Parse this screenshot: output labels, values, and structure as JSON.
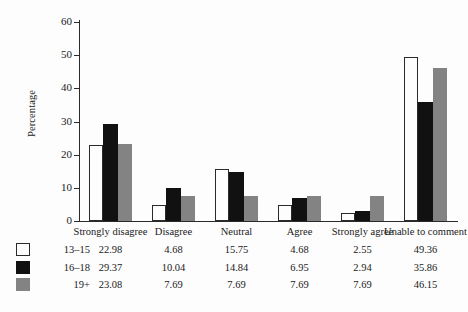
{
  "chart_data": {
    "type": "bar",
    "title": "",
    "xlabel": "",
    "ylabel": "Percentage",
    "ylim": [
      0,
      60
    ],
    "yticks": [
      0,
      10,
      20,
      30,
      40,
      50,
      60
    ],
    "grid": false,
    "legend_position": "bottom-left",
    "categories": [
      "Strongly disagree",
      "Disagree",
      "Neutral",
      "Agree",
      "Strongly agree",
      "Unable to comment"
    ],
    "series": [
      {
        "name": "13–15",
        "color": "#ffffff",
        "values": [
          22.98,
          4.68,
          15.75,
          4.68,
          2.55,
          49.36
        ]
      },
      {
        "name": "16–18",
        "color": "#111111",
        "values": [
          29.37,
          10.04,
          14.84,
          6.95,
          2.94,
          35.86
        ]
      },
      {
        "name": "19+",
        "color": "#838383",
        "values": [
          23.08,
          7.69,
          7.69,
          7.69,
          7.69,
          46.15
        ]
      }
    ],
    "data_table": {
      "row_labels": [
        "13–15",
        "16–18",
        "19+"
      ],
      "column_headers": [
        "Strongly disagree",
        "Disagree",
        "Neutral",
        "Agree",
        "Strongly agree",
        "Unable to comment"
      ],
      "rows": [
        [
          "22.98",
          "4.68",
          "15.75",
          "4.68",
          "2.55",
          "49.36"
        ],
        [
          "29.37",
          "10.04",
          "14.84",
          "6.95",
          "2.94",
          "35.86"
        ],
        [
          "23.08",
          "7.69",
          "7.69",
          "7.69",
          "7.69",
          "46.15"
        ]
      ]
    }
  }
}
